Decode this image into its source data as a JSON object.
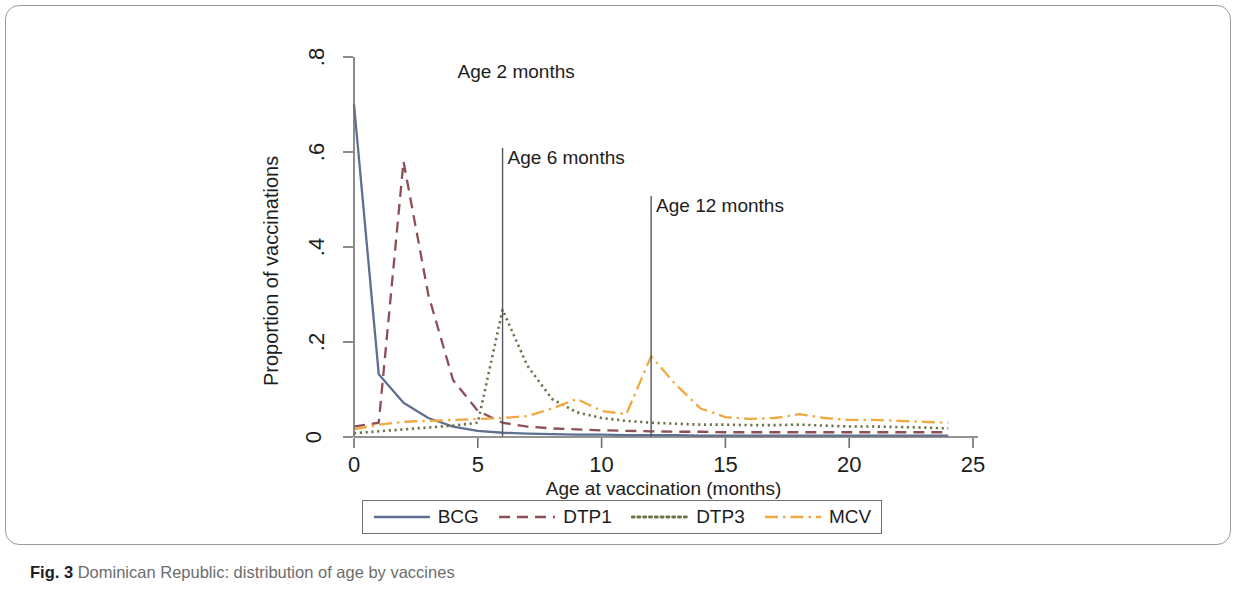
{
  "figure": {
    "caption_prefix": "Fig. 3",
    "caption_text": "Dominican Republic: distribution of age by vaccines"
  },
  "axes": {
    "xlabel": "Age at vaccination (months)",
    "ylabel": "Proportion of vaccinations",
    "xticks": [
      "0",
      "5",
      "10",
      "15",
      "20",
      "25"
    ],
    "yticks": [
      "0",
      ".2",
      ".4",
      ".6",
      ".8"
    ]
  },
  "annotations": [
    {
      "label": "Age 2 months",
      "x": 2
    },
    {
      "label": "Age 6 months",
      "x": 6
    },
    {
      "label": "Age 12 months",
      "x": 12
    }
  ],
  "legend": [
    {
      "label": "BCG",
      "color": "#5f6f91",
      "dash": "none"
    },
    {
      "label": "DTP1",
      "color": "#8d4e55",
      "dash": "dashed"
    },
    {
      "label": "DTP3",
      "color": "#6d7349",
      "dash": "dotted"
    },
    {
      "label": "MCV",
      "color": "#efa93f",
      "dash": "dashdot"
    }
  ],
  "chart_data": {
    "type": "line",
    "title": "Dominican Republic: distribution of age by vaccines",
    "xlabel": "Age at vaccination (months)",
    "ylabel": "Proportion of vaccinations",
    "xlim": [
      0,
      25
    ],
    "ylim": [
      0,
      0.8
    ],
    "xticks": [
      0,
      5,
      10,
      15,
      20,
      25
    ],
    "yticks": [
      0,
      0.2,
      0.4,
      0.6,
      0.8
    ],
    "grid": false,
    "legend_position": "bottom",
    "reference_lines": [
      {
        "x": 2,
        "label": "Age 2 months"
      },
      {
        "x": 6,
        "label": "Age 6 months"
      },
      {
        "x": 12,
        "label": "Age 12 months"
      }
    ],
    "x": [
      0,
      1,
      2,
      3,
      4,
      5,
      6,
      7,
      8,
      9,
      10,
      11,
      12,
      13,
      14,
      15,
      16,
      17,
      18,
      19,
      20,
      21,
      22,
      23,
      24
    ],
    "series": [
      {
        "name": "BCG",
        "color": "#5f6f91",
        "dash": "none",
        "values": [
          0.7,
          0.132,
          0.072,
          0.04,
          0.022,
          0.013,
          0.009,
          0.007,
          0.006,
          0.005,
          0.005,
          0.004,
          0.004,
          0.004,
          0.003,
          0.003,
          0.003,
          0.003,
          0.003,
          0.003,
          0.003,
          0.003,
          0.003,
          0.003,
          0.003
        ]
      },
      {
        "name": "DTP1",
        "color": "#8d4e55",
        "dash": "dashed",
        "values": [
          0.022,
          0.03,
          0.58,
          0.3,
          0.12,
          0.055,
          0.03,
          0.022,
          0.018,
          0.016,
          0.014,
          0.013,
          0.012,
          0.011,
          0.011,
          0.01,
          0.01,
          0.01,
          0.01,
          0.01,
          0.01,
          0.01,
          0.01,
          0.01,
          0.01
        ]
      },
      {
        "name": "DTP3",
        "color": "#6d7349",
        "dash": "dotted",
        "values": [
          0.008,
          0.012,
          0.016,
          0.02,
          0.024,
          0.03,
          0.268,
          0.15,
          0.08,
          0.052,
          0.04,
          0.034,
          0.03,
          0.028,
          0.026,
          0.026,
          0.025,
          0.025,
          0.026,
          0.024,
          0.022,
          0.022,
          0.021,
          0.02,
          0.018
        ]
      },
      {
        "name": "MCV",
        "color": "#efa93f",
        "dash": "dashdot",
        "values": [
          0.016,
          0.026,
          0.032,
          0.034,
          0.036,
          0.038,
          0.04,
          0.044,
          0.06,
          0.08,
          0.055,
          0.048,
          0.17,
          0.11,
          0.06,
          0.042,
          0.038,
          0.04,
          0.048,
          0.04,
          0.036,
          0.036,
          0.034,
          0.032,
          0.03
        ]
      }
    ]
  }
}
